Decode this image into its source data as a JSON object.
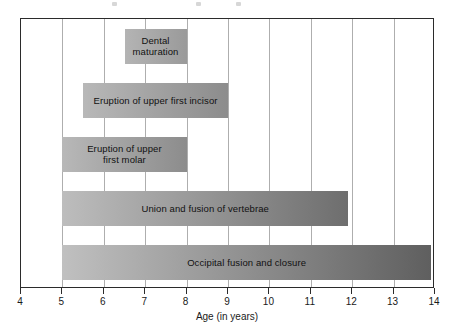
{
  "chart_data": {
    "type": "bar",
    "orientation": "horizontal",
    "title": "",
    "xlabel": "Age (in years)",
    "ylabel": "",
    "xlim": [
      4,
      14
    ],
    "ylim": [
      0,
      5
    ],
    "grid": true,
    "legend": false,
    "xticks": [
      4,
      5,
      6,
      7,
      8,
      9,
      10,
      11,
      12,
      13,
      14
    ],
    "xtick_labels": [
      "4",
      "5",
      "6",
      "7",
      "8",
      "9",
      "10",
      "11",
      "12",
      "13",
      "14"
    ],
    "categories": [
      "Dental maturation",
      "Eruption of upper first incisor",
      "Eruption of upper first molar",
      "Union and fusion of vertebrae",
      "Occipital fusion and closure"
    ],
    "bars": [
      {
        "label": "Dental\nmaturation",
        "label_flat": "Dental maturation",
        "start": 6.5,
        "end": 8.0,
        "duration": 1.5,
        "color_start": "#b4b4b4",
        "color_end": "#9a9a9a"
      },
      {
        "label": "Eruption of upper first incisor",
        "label_flat": "Eruption of upper first incisor",
        "start": 5.5,
        "end": 9.0,
        "duration": 3.5,
        "color_start": "#b8b8b8",
        "color_end": "#8c8c8c"
      },
      {
        "label": "Eruption of upper\nfirst molar",
        "label_flat": "Eruption of upper first molar",
        "start": 5.0,
        "end": 8.0,
        "duration": 3.0,
        "color_start": "#b8b8b8",
        "color_end": "#8c8c8c"
      },
      {
        "label": "Union and fusion of vertebrae",
        "label_flat": "Union and fusion of vertebrae",
        "start": 5.0,
        "end": 11.9,
        "duration": 6.9,
        "color_start": "#bdbdbd",
        "color_end": "#6e6e6e"
      },
      {
        "label": "Occipital fusion and closure",
        "label_flat": "Occipital fusion and closure",
        "start": 5.0,
        "end": 13.9,
        "duration": 8.9,
        "color_start": "#c0c0c0",
        "color_end": "#5f5f5f"
      }
    ],
    "axis_color": "#2b2b2b",
    "gridline_color": "#aeaeae"
  }
}
